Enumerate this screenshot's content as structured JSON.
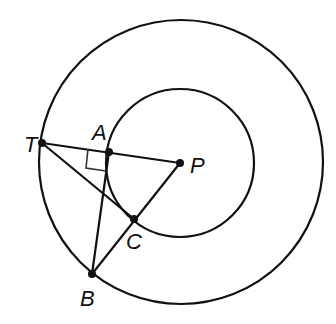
{
  "diagram": {
    "outer_circle": {
      "cx": 181,
      "cy": 162,
      "r": 142
    },
    "inner_circle": {
      "cx": 180,
      "cy": 163,
      "r": 74
    },
    "points": {
      "T": {
        "x": 42,
        "y": 143,
        "label": "T",
        "lx": 24,
        "ly": 152
      },
      "A": {
        "x": 109,
        "y": 152,
        "label": "A",
        "lx": 92,
        "ly": 140
      },
      "P": {
        "x": 180,
        "y": 163,
        "label": "P",
        "lx": 190,
        "ly": 173
      },
      "C": {
        "x": 134,
        "y": 219,
        "label": "C",
        "lx": 126,
        "ly": 249
      },
      "B": {
        "x": 92,
        "y": 274,
        "label": "B",
        "lx": 80,
        "ly": 306
      }
    },
    "segments": [
      {
        "from": "T",
        "to": "P",
        "name": "segment-TP"
      },
      {
        "from": "T",
        "to": "C",
        "name": "segment-TC"
      },
      {
        "from": "A",
        "to": "B",
        "name": "segment-AB"
      },
      {
        "from": "B",
        "to": "P",
        "name": "segment-BP"
      }
    ],
    "right_angle_at": "A",
    "colors": {
      "line": "#111111",
      "marker": "#333333",
      "background": "#ffffff"
    }
  }
}
